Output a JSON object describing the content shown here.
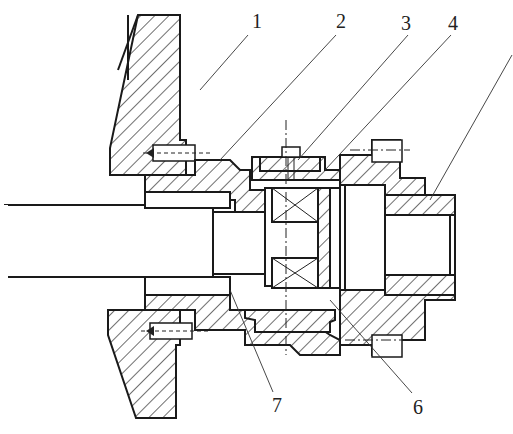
{
  "figure": {
    "type": "mechanical-cross-section",
    "callouts": [
      {
        "id": "1",
        "label": "1"
      },
      {
        "id": "2",
        "label": "2"
      },
      {
        "id": "3",
        "label": "3"
      },
      {
        "id": "4",
        "label": "4"
      },
      {
        "id": "6",
        "label": "6"
      },
      {
        "id": "7",
        "label": "7"
      }
    ],
    "colors": {
      "line": "#1a1a1a",
      "background": "#ffffff"
    }
  }
}
